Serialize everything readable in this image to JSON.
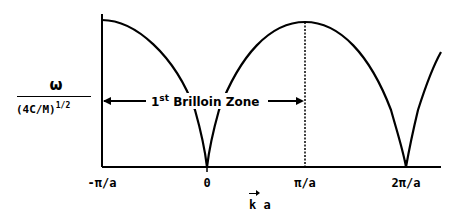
{
  "diagram": {
    "y_axis": {
      "numerator": "ω",
      "denominator": "(4C/M)",
      "exponent": "1/2"
    },
    "x_axis": {
      "label_vector": "k",
      "label_suffix": " a",
      "ticks": [
        {
          "label": "-π/a",
          "x": 102
        },
        {
          "label": "0",
          "x": 207
        },
        {
          "label": "π/a",
          "x": 305
        },
        {
          "label": "2π/a",
          "x": 406
        }
      ]
    },
    "annotation": {
      "ordinal": "1",
      "ordinal_suffix": "st",
      "text": " Brilloin Zone"
    },
    "curve": "|sin(ka/2)|",
    "colors": {
      "line": "#000000",
      "background": "#ffffff"
    }
  }
}
